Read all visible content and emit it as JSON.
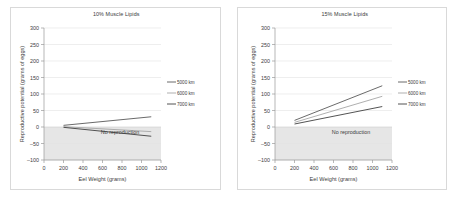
{
  "figure": {
    "background": "#ffffff",
    "border_color": "#d9d9d9",
    "shade_color": "#e2e2e2",
    "series_colors": [
      "#595959",
      "#a6a6a6",
      "#404040"
    ]
  },
  "panels": [
    {
      "id": "panel-10",
      "title": "10% Muscle Lipids",
      "annotation": "No reproduction",
      "xlabel": "Eel Weight (grams)",
      "ylabel": "Reproductive potential (grams of eggs)",
      "xticks": [
        "0",
        "200",
        "400",
        "600",
        "800",
        "1000",
        "1200"
      ],
      "yticks": [
        "300",
        "250",
        "200",
        "150",
        "100",
        "50",
        "0",
        "-50",
        "-100"
      ],
      "legend": [
        "5000 km",
        "6000 km",
        "7000 km"
      ]
    },
    {
      "id": "panel-15",
      "title": "15% Muscle Lipids",
      "annotation": "No reproduction",
      "xlabel": "Eel Weight (grams)",
      "ylabel": "Reproductive potential (grams of eggs)",
      "xticks": [
        "0",
        "200",
        "400",
        "600",
        "800",
        "1000",
        "1200"
      ],
      "yticks": [
        "300",
        "250",
        "200",
        "150",
        "100",
        "50",
        "0",
        "-50",
        "-100"
      ],
      "legend": [
        "5000 km",
        "6000 km",
        "7000 km"
      ]
    }
  ],
  "chart_data": [
    {
      "type": "line",
      "title": "10% Muscle Lipids",
      "xlabel": "Eel Weight (grams)",
      "ylabel": "Reproductive potential (grams of eggs)",
      "xlim": [
        0,
        1200
      ],
      "ylim": [
        -100,
        300
      ],
      "xticks": [
        0,
        200,
        400,
        600,
        800,
        1000,
        1200
      ],
      "yticks": [
        -100,
        -50,
        0,
        50,
        100,
        150,
        200,
        250,
        300
      ],
      "grid": true,
      "legend_position": "right",
      "annotations": [
        {
          "text": "No reproduction",
          "x": 780,
          "y": -22
        }
      ],
      "shaded_regions": [
        {
          "label": "No reproduction",
          "y_from": -100,
          "y_to": 0,
          "color": "#e2e2e2"
        }
      ],
      "x": [
        200,
        1100
      ],
      "series": [
        {
          "name": "5000 km",
          "values": [
            5,
            31
          ],
          "color": "#595959"
        },
        {
          "name": "6000 km",
          "values": [
            1,
            -14
          ],
          "color": "#a6a6a6"
        },
        {
          "name": "7000 km",
          "values": [
            -1,
            -28
          ],
          "color": "#404040"
        }
      ]
    },
    {
      "type": "line",
      "title": "15% Muscle Lipids",
      "xlabel": "Eel Weight (grams)",
      "ylabel": "Reproductive potential (grams of eggs)",
      "xlim": [
        0,
        1200
      ],
      "ylim": [
        -100,
        300
      ],
      "xticks": [
        0,
        200,
        400,
        600,
        800,
        1000,
        1200
      ],
      "yticks": [
        -100,
        -50,
        0,
        50,
        100,
        150,
        200,
        250,
        300
      ],
      "grid": true,
      "legend_position": "right",
      "annotations": [
        {
          "text": "No reproduction",
          "x": 780,
          "y": -22
        }
      ],
      "shaded_regions": [
        {
          "label": "No reproduction",
          "y_from": -100,
          "y_to": 0,
          "color": "#e2e2e2"
        }
      ],
      "x": [
        200,
        1100
      ],
      "series": [
        {
          "name": "5000 km",
          "values": [
            20,
            125
          ],
          "color": "#595959"
        },
        {
          "name": "6000 km",
          "values": [
            14,
            93
          ],
          "color": "#a6a6a6"
        },
        {
          "name": "7000 km",
          "values": [
            9,
            62
          ],
          "color": "#404040"
        }
      ]
    }
  ]
}
